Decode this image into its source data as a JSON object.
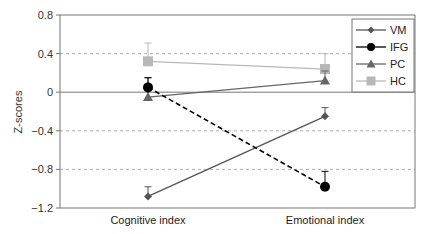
{
  "chart_data": {
    "type": "line",
    "title": "",
    "xlabel": "",
    "ylabel": "Z-scores",
    "categories": [
      "Cognitive index",
      "Emotional index"
    ],
    "ylim": [
      -1.2,
      0.8
    ],
    "yticks": [
      0.8,
      0.4,
      0,
      -0.4,
      -0.8,
      -1.2
    ],
    "ytick_labels": [
      "0.8",
      "0.4",
      "0",
      "−0.4",
      "−0.8",
      "−1.2"
    ],
    "grid": "dashed horizontal at ±0.4 and −0.8; solid at 0",
    "legend_position": "top-right",
    "series": [
      {
        "name": "VM",
        "values": [
          -1.08,
          -0.25
        ],
        "error_upper": [
          -0.98,
          -0.16
        ],
        "color": "#555555",
        "marker": "diamond",
        "dash": false
      },
      {
        "name": "IFG",
        "values": [
          0.05,
          -0.98
        ],
        "error_upper": [
          0.15,
          -0.82
        ],
        "color": "#000000",
        "marker": "circle",
        "dash": true
      },
      {
        "name": "PC",
        "values": [
          -0.05,
          0.12
        ],
        "error_upper": [
          0.15,
          0.22
        ],
        "color": "#666666",
        "marker": "triangle",
        "dash": false
      },
      {
        "name": "HC",
        "values": [
          0.32,
          0.24
        ],
        "error_upper": [
          0.51,
          0.4
        ],
        "color": "#b8b8b8",
        "marker": "square",
        "dash": false
      }
    ]
  }
}
